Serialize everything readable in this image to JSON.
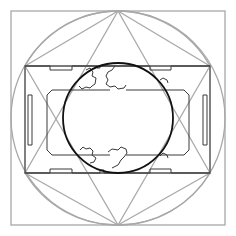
{
  "diagram": {
    "width": 236,
    "height": 236,
    "colors": {
      "construction": "#a8a8a8",
      "outline": "#3a3a3a",
      "inner_circle": "#111111",
      "background": "#ffffff"
    },
    "outer_square": {
      "x": 11,
      "y": 11,
      "w": 214,
      "h": 214
    },
    "outer_circle": {
      "cx": 118,
      "cy": 118,
      "r": 107
    },
    "inner_rectangle": {
      "x": 25,
      "y": 66,
      "w": 185,
      "h": 107
    },
    "inner_circle": {
      "cx": 118,
      "cy": 118,
      "r": 55
    },
    "triangle_up": "118,11 210,173 25,173",
    "triangle_down": "118,225 210,66 25,66",
    "quarter_arcs": [
      "M 25 66 A 107 107 0 0 1 118 11",
      "M 118 11 A 107 107 0 0 1 210 66",
      "M 210 173 A 107 107 0 0 1 118 225",
      "M 118 225 A 107 107 0 0 1 25 173"
    ],
    "diagonal_chords": [
      "25,66 118,11",
      "118,11 210,66",
      "210,173 118,225",
      "118,225 25,173",
      "25,66 25,173",
      "210,66 210,173"
    ],
    "outline_path_top": "M 25 66 L 50 66 L 50 70 L 72 70 L 72 66 L 97 66 L 97 68 L 100 68 L 100 66 L 150 66 L 150 70 L 171 70 L 171 66 L 210 66",
    "outline_path_bottom": "M 25 173 L 50 173 L 50 169 L 72 169 L 72 173 L 100 173 L 100 170 L 104 170 L 104 173 L 150 173 L 150 169 L 171 169 L 171 173 L 210 173",
    "outline_path_left": "M 28 95 L 28 145 L 32 145 L 32 95 Z",
    "outline_path_right": "M 203 95 L 203 145 L 207 145 L 207 95 Z",
    "inner_frame_left": "M 110 90 L 52 90 L 47 95 L 47 150 L 52 155 L 110 155",
    "inner_frame_right": "M 126 90 L 184 90 L 189 95 L 189 150 L 184 155 L 126 155",
    "clouds": [
      "M 86 70 L 90 68 L 93 72 L 92 76 L 96 78 L 95 84 L 92 86 L 90 88 L 86 87 L 82 89 L 79 86",
      "M 115 66 L 112 70 L 108 72 L 106 76 L 108 80 L 106 84 L 110 87 L 115 86 L 118 89 L 124 88 L 126 85",
      "M 80 150 L 83 147 L 86 149 L 90 148 L 93 151 L 92 155 L 96 158 L 94 162 L 90 163",
      "M 108 152 L 112 149 L 118 150 L 121 147 L 126 149 L 127 153 L 124 157 L 121 160 L 118 165 L 112 168",
      "M 160 80 L 163 78 L 167 80 L 168 83",
      "M 160 156 L 163 153 L 167 155 L 168 158"
    ]
  }
}
